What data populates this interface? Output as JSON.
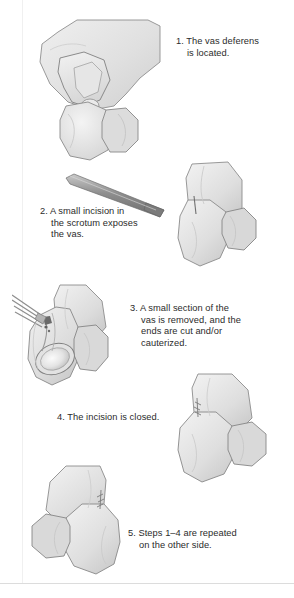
{
  "document": {
    "title": "Vasectomy procedure steps",
    "background_color": "#ffffff",
    "text_color": "#2b2b2b"
  },
  "steps": [
    {
      "number": "1.",
      "caption": "1. The vas deferens\nis located.",
      "figure_name": "hand-isolating-vas-illustration",
      "figure_alt": "Gloved hand grasping the scrotum to isolate the vas deferens"
    },
    {
      "number": "2.",
      "caption": "2. A small incision in\nthe scrotum exposes\nthe vas.",
      "figure_name": "scalpel-incision-illustration",
      "figure_alt": "Scalpel making a small incision in the scrotum"
    },
    {
      "number": "3.",
      "caption": "3. A small section of the\nvas is removed, and the\nends are cut and/or\ncauterized.",
      "figure_name": "vas-section-removed-illustration",
      "figure_alt": "Cutaway view of the scrotum with instruments cutting the vas deferens above the testicle"
    },
    {
      "number": "4.",
      "caption": "4. The incision is closed.",
      "figure_name": "incision-closed-illustration",
      "figure_alt": "Scrotum with the incision closed by small sutures"
    },
    {
      "number": "5.",
      "caption": "5. Steps 1–4 are repeated\non the other side.",
      "figure_name": "opposite-side-repeat-illustration",
      "figure_alt": "Mirrored view of the scrotum showing the procedure repeated on the other side"
    }
  ],
  "colors": {
    "skin_light": "#ebebeb",
    "skin_mid": "#dedede",
    "skin_shadow": "#cacaca",
    "outline": "#8c8c8c",
    "instrument": "#9a9a9a",
    "instrument_dark": "#6f6f6f",
    "rule": "#dcdcdc"
  }
}
